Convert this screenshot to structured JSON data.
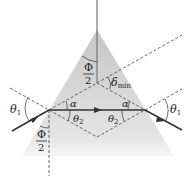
{
  "diagram": {
    "colors": {
      "prism_fill_top": "#c9c9c9",
      "prism_fill_bottom": "#f2f2f2",
      "ray": "#333333",
      "dashed": "#444444"
    },
    "labels": {
      "theta1_left": "θ",
      "theta1_left_sub": "1",
      "theta1_right": "θ",
      "theta1_right_sub": "1",
      "alpha_left": "α",
      "alpha_right": "α",
      "theta2_left": "θ",
      "theta2_left_sub": "2",
      "theta2_right": "θ",
      "theta2_right_sub": "2",
      "phi_top_num": "Φ",
      "phi_top_den": "2",
      "phi_bottom_num": "Φ",
      "phi_bottom_den": "2",
      "delta": "δ",
      "delta_sub": "min"
    }
  }
}
